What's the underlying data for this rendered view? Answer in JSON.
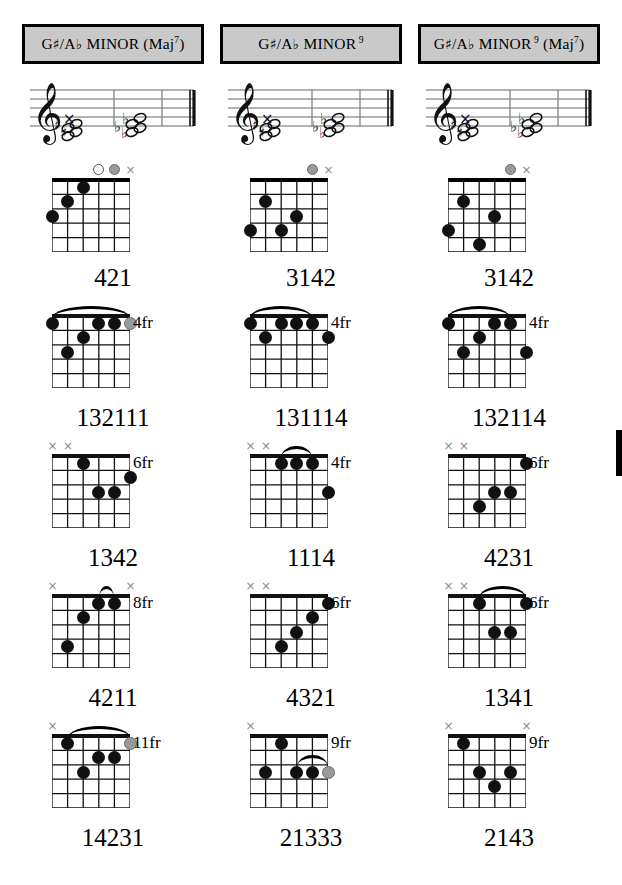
{
  "page": {
    "width": 622,
    "height": 885,
    "background": "#ffffff",
    "title_box_fill": "#c9c9c9",
    "dot_color": "#111111",
    "muted_dot_color": "#9a9a9a"
  },
  "columns": [
    {
      "title": {
        "root": "G",
        "root_accidental": "♯",
        "slash": "/",
        "alt_root": "A",
        "alt_accidental": "♭",
        "quality": "MINOR",
        "extension": "",
        "paren": "(Maj",
        "paren_sup": "7",
        "paren_close": ")",
        "full_text": "G♯/A♭ MINOR (Maj7)"
      },
      "staff": {
        "clef": "treble-clef",
        "description": "treble staff with chord notes"
      },
      "chords": [
        {
          "position_label": "",
          "fingering": "421",
          "open_markers": [
            {
              "string": 4,
              "type": "open"
            },
            {
              "string": 5,
              "type": "gray"
            },
            {
              "string": 6,
              "type": "muted"
            }
          ],
          "dots": [
            {
              "string": 1,
              "fret": 3,
              "color": "black"
            },
            {
              "string": 2,
              "fret": 2,
              "color": "black"
            },
            {
              "string": 3,
              "fret": 1,
              "color": "black"
            }
          ],
          "barre": null
        },
        {
          "position_label": "4fr",
          "fingering": "132111",
          "open_markers": [],
          "dots": [
            {
              "string": 1,
              "fret": 1,
              "color": "black"
            },
            {
              "string": 2,
              "fret": 3,
              "color": "black"
            },
            {
              "string": 3,
              "fret": 2,
              "color": "black"
            },
            {
              "string": 4,
              "fret": 1,
              "color": "black"
            },
            {
              "string": 5,
              "fret": 1,
              "color": "black"
            },
            {
              "string": 6,
              "fret": 1,
              "color": "gray"
            }
          ],
          "barre": {
            "from_string": 1,
            "to_string": 6,
            "fret": 1
          }
        },
        {
          "position_label": "6fr",
          "fingering": "1342",
          "open_markers": [
            {
              "string": 1,
              "type": "muted"
            },
            {
              "string": 2,
              "type": "muted"
            }
          ],
          "dots": [
            {
              "string": 3,
              "fret": 1,
              "color": "black"
            },
            {
              "string": 4,
              "fret": 3,
              "color": "black"
            },
            {
              "string": 5,
              "fret": 3,
              "color": "black"
            },
            {
              "string": 6,
              "fret": 2,
              "color": "black"
            }
          ],
          "barre": null
        },
        {
          "position_label": "8fr",
          "fingering": "4211",
          "open_markers": [
            {
              "string": 1,
              "type": "muted"
            },
            {
              "string": 6,
              "type": "muted"
            }
          ],
          "dots": [
            {
              "string": 2,
              "fret": 4,
              "color": "black"
            },
            {
              "string": 3,
              "fret": 2,
              "color": "black"
            },
            {
              "string": 4,
              "fret": 1,
              "color": "black"
            },
            {
              "string": 5,
              "fret": 1,
              "color": "black"
            }
          ],
          "barre": {
            "from_string": 4,
            "to_string": 5,
            "fret": 1
          }
        },
        {
          "position_label": "11fr",
          "fingering": "14231",
          "open_markers": [
            {
              "string": 1,
              "type": "muted"
            }
          ],
          "dots": [
            {
              "string": 2,
              "fret": 1,
              "color": "black"
            },
            {
              "string": 3,
              "fret": 3,
              "color": "black"
            },
            {
              "string": 4,
              "fret": 2,
              "color": "black"
            },
            {
              "string": 5,
              "fret": 2,
              "color": "black"
            },
            {
              "string": 6,
              "fret": 1,
              "color": "gray"
            }
          ],
          "barre": {
            "from_string": 2,
            "to_string": 6,
            "fret": 1
          }
        }
      ]
    },
    {
      "title": {
        "root": "G",
        "root_accidental": "♯",
        "slash": "/",
        "alt_root": "A",
        "alt_accidental": "♭",
        "quality": "MINOR",
        "extension": "9",
        "paren": "",
        "paren_sup": "",
        "paren_close": "",
        "full_text": "G♯/A♭ MINOR 9"
      },
      "staff": {
        "clef": "treble-clef",
        "description": "treble staff with chord notes"
      },
      "chords": [
        {
          "position_label": "",
          "fingering": "3142",
          "open_markers": [
            {
              "string": 5,
              "type": "gray"
            },
            {
              "string": 6,
              "type": "muted"
            }
          ],
          "dots": [
            {
              "string": 1,
              "fret": 4,
              "color": "black"
            },
            {
              "string": 2,
              "fret": 2,
              "color": "black"
            },
            {
              "string": 3,
              "fret": 4,
              "color": "black"
            },
            {
              "string": 4,
              "fret": 3,
              "color": "black"
            }
          ],
          "barre": null
        },
        {
          "position_label": "4fr",
          "fingering": "131114",
          "open_markers": [],
          "dots": [
            {
              "string": 1,
              "fret": 1,
              "color": "black"
            },
            {
              "string": 2,
              "fret": 2,
              "color": "black"
            },
            {
              "string": 3,
              "fret": 1,
              "color": "black"
            },
            {
              "string": 4,
              "fret": 1,
              "color": "black"
            },
            {
              "string": 5,
              "fret": 1,
              "color": "black"
            },
            {
              "string": 6,
              "fret": 2,
              "color": "black"
            }
          ],
          "barre": {
            "from_string": 1,
            "to_string": 5,
            "fret": 1
          }
        },
        {
          "position_label": "4fr",
          "fingering": "1114",
          "open_markers": [
            {
              "string": 1,
              "type": "muted"
            },
            {
              "string": 2,
              "type": "muted"
            }
          ],
          "dots": [
            {
              "string": 3,
              "fret": 1,
              "color": "black"
            },
            {
              "string": 4,
              "fret": 1,
              "color": "black"
            },
            {
              "string": 5,
              "fret": 1,
              "color": "black"
            },
            {
              "string": 6,
              "fret": 3,
              "color": "black"
            }
          ],
          "barre": {
            "from_string": 3,
            "to_string": 5,
            "fret": 1
          }
        },
        {
          "position_label": "6fr",
          "fingering": "4321",
          "open_markers": [
            {
              "string": 1,
              "type": "muted"
            },
            {
              "string": 2,
              "type": "muted"
            }
          ],
          "dots": [
            {
              "string": 3,
              "fret": 4,
              "color": "black"
            },
            {
              "string": 4,
              "fret": 3,
              "color": "black"
            },
            {
              "string": 5,
              "fret": 2,
              "color": "black"
            },
            {
              "string": 6,
              "fret": 1,
              "color": "black"
            }
          ],
          "barre": null
        },
        {
          "position_label": "9fr",
          "fingering": "21333",
          "open_markers": [
            {
              "string": 1,
              "type": "muted"
            }
          ],
          "dots": [
            {
              "string": 2,
              "fret": 3,
              "color": "black"
            },
            {
              "string": 3,
              "fret": 1,
              "color": "black"
            },
            {
              "string": 4,
              "fret": 3,
              "color": "black"
            },
            {
              "string": 5,
              "fret": 3,
              "color": "black"
            },
            {
              "string": 6,
              "fret": 3,
              "color": "gray"
            }
          ],
          "barre": {
            "from_string": 4,
            "to_string": 6,
            "fret": 3
          }
        }
      ]
    },
    {
      "title": {
        "root": "G",
        "root_accidental": "♯",
        "slash": "/",
        "alt_root": "A",
        "alt_accidental": "♭",
        "quality": "MINOR",
        "extension": "9",
        "paren": "(Maj",
        "paren_sup": "7",
        "paren_close": ")",
        "full_text": "G♯/A♭ MINOR 9 (Maj7)"
      },
      "staff": {
        "clef": "treble-clef",
        "description": "treble staff with chord notes"
      },
      "chords": [
        {
          "position_label": "",
          "fingering": "3142",
          "open_markers": [
            {
              "string": 5,
              "type": "gray"
            },
            {
              "string": 6,
              "type": "muted"
            }
          ],
          "dots": [
            {
              "string": 1,
              "fret": 4,
              "color": "black"
            },
            {
              "string": 2,
              "fret": 2,
              "color": "black"
            },
            {
              "string": 3,
              "fret": 5,
              "color": "black"
            },
            {
              "string": 4,
              "fret": 3,
              "color": "black"
            }
          ],
          "barre": null
        },
        {
          "position_label": "4fr",
          "fingering": "132114",
          "open_markers": [],
          "dots": [
            {
              "string": 1,
              "fret": 1,
              "color": "black"
            },
            {
              "string": 2,
              "fret": 3,
              "color": "black"
            },
            {
              "string": 3,
              "fret": 2,
              "color": "black"
            },
            {
              "string": 4,
              "fret": 1,
              "color": "black"
            },
            {
              "string": 5,
              "fret": 1,
              "color": "black"
            },
            {
              "string": 6,
              "fret": 3,
              "color": "black"
            }
          ],
          "barre": {
            "from_string": 1,
            "to_string": 5,
            "fret": 1
          }
        },
        {
          "position_label": "6fr",
          "fingering": "4231",
          "open_markers": [
            {
              "string": 1,
              "type": "muted"
            },
            {
              "string": 2,
              "type": "muted"
            }
          ],
          "dots": [
            {
              "string": 3,
              "fret": 4,
              "color": "black"
            },
            {
              "string": 4,
              "fret": 3,
              "color": "black"
            },
            {
              "string": 5,
              "fret": 3,
              "color": "black"
            },
            {
              "string": 6,
              "fret": 1,
              "color": "black"
            }
          ],
          "barre": null
        },
        {
          "position_label": "6fr",
          "fingering": "1341",
          "open_markers": [
            {
              "string": 1,
              "type": "muted"
            },
            {
              "string": 2,
              "type": "muted"
            }
          ],
          "dots": [
            {
              "string": 3,
              "fret": 1,
              "color": "black"
            },
            {
              "string": 4,
              "fret": 3,
              "color": "black"
            },
            {
              "string": 5,
              "fret": 3,
              "color": "black"
            },
            {
              "string": 6,
              "fret": 1,
              "color": "black"
            }
          ],
          "barre": {
            "from_string": 3,
            "to_string": 6,
            "fret": 1
          }
        },
        {
          "position_label": "9fr",
          "fingering": "2143",
          "open_markers": [
            {
              "string": 1,
              "type": "muted"
            },
            {
              "string": 6,
              "type": "muted"
            }
          ],
          "dots": [
            {
              "string": 2,
              "fret": 1,
              "color": "black"
            },
            {
              "string": 3,
              "fret": 3,
              "color": "black"
            },
            {
              "string": 4,
              "fret": 4,
              "color": "black"
            },
            {
              "string": 5,
              "fret": 3,
              "color": "black"
            }
          ],
          "barre": null
        }
      ]
    }
  ],
  "symbols": {
    "muted": "×",
    "sharp": "♯",
    "flat": "♭"
  }
}
